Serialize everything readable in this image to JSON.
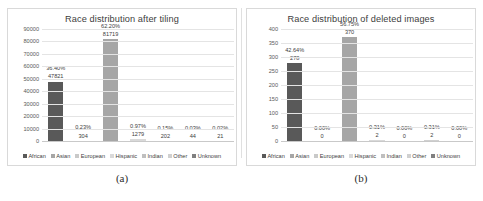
{
  "figure": {
    "panels": [
      {
        "caption": "(a)",
        "title": "Race distribution after tiling",
        "chart_ref": 0
      },
      {
        "caption": "(b)",
        "title": "Race distribution of deleted images",
        "chart_ref": 1
      }
    ]
  },
  "legend": {
    "entries": [
      {
        "label": "African",
        "color": "#595959"
      },
      {
        "label": "Asian",
        "color": "#a6a6a6"
      },
      {
        "label": "European",
        "color": "#c9c9c9"
      },
      {
        "label": "Hispanic",
        "color": "#d9d9d9"
      },
      {
        "label": "Indian",
        "color": "#bfbfbf"
      },
      {
        "label": "Other",
        "color": "#d0d0d0"
      },
      {
        "label": "Unknown",
        "color": "#808080"
      }
    ]
  },
  "chart_data": [
    {
      "type": "bar",
      "title": "Race distribution after tiling",
      "xlabel": "",
      "ylabel": "",
      "ylim": [
        0,
        90000
      ],
      "yticks": [
        "0",
        "10000",
        "20000",
        "30000",
        "40000",
        "50000",
        "60000",
        "70000",
        "80000",
        "90000"
      ],
      "grid": true,
      "legend_position": "bottom",
      "categories": [
        "African",
        "Asian",
        "European",
        "Hispanic",
        "Indian",
        "Other",
        "Unknown"
      ],
      "values": [
        47821,
        304,
        81719,
        1279,
        202,
        44,
        21
      ],
      "percent_labels": [
        "36.40%",
        "0.23%",
        "62.20%",
        "0.97%",
        "0.15%",
        "0.03%",
        "0.02%"
      ],
      "value_labels": [
        "47821",
        "304",
        "81719",
        "1279",
        "202",
        "44",
        "21"
      ],
      "colors": [
        "#595959",
        "#a6a6a6",
        "#a6a6a6",
        "#d9d9d9",
        "#bfbfbf",
        "#d0d0d0",
        "#808080"
      ]
    },
    {
      "type": "bar",
      "title": "Race distribution of deleted images",
      "xlabel": "",
      "ylabel": "",
      "ylim": [
        0,
        400
      ],
      "yticks": [
        "0",
        "50",
        "100",
        "150",
        "200",
        "250",
        "300",
        "350",
        "400"
      ],
      "grid": true,
      "legend_position": "bottom",
      "categories": [
        "African",
        "Asian",
        "European",
        "Hispanic",
        "Indian",
        "Other",
        "Unknown"
      ],
      "values": [
        278,
        0,
        370,
        2,
        0,
        2,
        0
      ],
      "percent_labels": [
        "42.64%",
        "0.00%",
        "56.75%",
        "0.31%",
        "0.00%",
        "0.31%",
        "0.00%"
      ],
      "value_labels": [
        "278",
        "0",
        "370",
        "2",
        "0",
        "2",
        "0"
      ],
      "colors": [
        "#595959",
        "#a6a6a6",
        "#a6a6a6",
        "#d9d9d9",
        "#bfbfbf",
        "#d0d0d0",
        "#808080"
      ]
    }
  ]
}
